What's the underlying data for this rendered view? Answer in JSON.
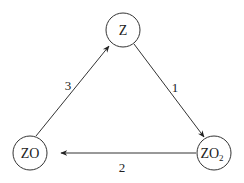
{
  "diagram": {
    "type": "cycle",
    "nodes": [
      {
        "id": "Z",
        "label": "Z",
        "sub": ""
      },
      {
        "id": "ZO",
        "label": "ZO",
        "sub": ""
      },
      {
        "id": "ZO2",
        "label": "ZO",
        "sub": "2"
      }
    ],
    "edges": [
      {
        "from": "Z",
        "to": "ZO2",
        "label": "1"
      },
      {
        "from": "ZO2",
        "to": "ZO",
        "label": "2"
      },
      {
        "from": "ZO",
        "to": "Z",
        "label": "3"
      }
    ],
    "colors": {
      "stroke": "#222222",
      "background": "#ffffff"
    }
  }
}
